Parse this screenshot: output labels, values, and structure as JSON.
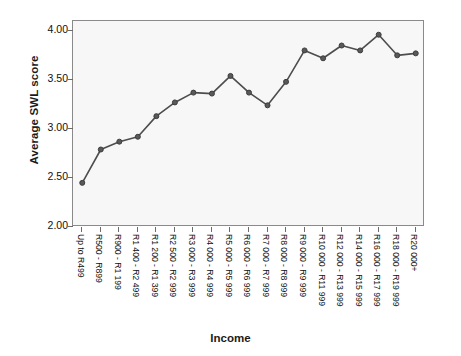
{
  "chart_data": {
    "type": "line",
    "title": "",
    "xlabel": "Income",
    "ylabel": "Average SWL score",
    "ylim": [
      2.0,
      4.1
    ],
    "yticks": [
      "2.00",
      "2.50",
      "3.00",
      "3.50",
      "4.00"
    ],
    "ytick_values": [
      2.0,
      2.5,
      3.0,
      3.5,
      4.0
    ],
    "grid": false,
    "legend": null,
    "marker": "circle",
    "line_color": "#4d4d4d",
    "marker_color": "#595959",
    "plot_background": "#f7f7f7",
    "categories": [
      "Up to R499",
      "R500 - R899",
      "R900 - R1 199",
      "R1 400 - R2 499",
      "R1 200 - R1 399",
      "R2 500 - R2 999",
      "R3 000 - R3 999",
      "R4 000 - R4 999",
      "R5 000 - R5 999",
      "R6 000 - R6 999",
      "R7 000 - R7 999",
      "R8 000 - R8 999",
      "R9 000 - R9 999",
      "R10 000 - R11 999",
      "R12 000 - R13 999",
      "R14 000 - R15 999",
      "R16 000 - R17 999",
      "R18 000 - R19 999",
      "R20 000+"
    ],
    "values": [
      2.45,
      2.79,
      2.87,
      2.92,
      3.13,
      3.27,
      3.37,
      3.36,
      3.54,
      3.37,
      3.24,
      3.48,
      3.8,
      3.72,
      3.85,
      3.8,
      3.96,
      3.75,
      3.77
    ]
  }
}
